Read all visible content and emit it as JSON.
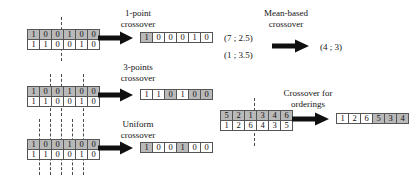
{
  "figure": {
    "title_hidden": "",
    "bit_shaded_color": "#b9b9b9",
    "bit_plain_color": "#ffffff",
    "border_color": "#555555",
    "arrow_color": "#101010",
    "dash_color": "#4a4a4a"
  },
  "binary_parents": {
    "parent1": [
      "1",
      "0",
      "0",
      "1",
      "0",
      "0"
    ],
    "parent2": [
      "1",
      "1",
      "0",
      "0",
      "1",
      "0"
    ]
  },
  "one_point": {
    "label_line1": "1-point",
    "label_line2": "crossover",
    "cut_positions": [
      3
    ],
    "result": {
      "values": [
        "1",
        "0",
        "0",
        "0",
        "1",
        "0"
      ],
      "shading": [
        "shade",
        "plain",
        "plain",
        "plain",
        "plain",
        "plain"
      ]
    }
  },
  "three_points": {
    "label_line1": "3-points",
    "label_line2": "crossover",
    "cut_positions": [
      2,
      3,
      5
    ],
    "result": {
      "values": [
        "1",
        "1",
        "0",
        "1",
        "0",
        "0"
      ],
      "shading": [
        "plain",
        "plain",
        "shade",
        "plain",
        "shade",
        "shade"
      ]
    }
  },
  "uniform": {
    "label_line1": "Uniform",
    "label_line2": "crossover",
    "cut_positions": [
      1,
      2,
      3,
      4,
      5
    ],
    "result": {
      "values": [
        "1",
        "0",
        "0",
        "1",
        "0",
        "0"
      ],
      "shading": [
        "shade",
        "plain",
        "plain",
        "shade",
        "plain",
        "plain"
      ]
    }
  },
  "mean_based": {
    "label_line1": "Mean-based",
    "label_line2": "crossover",
    "parent1": "(7 ; 2.5)",
    "parent2": "(1 ; 3.5)",
    "result": "(4 ; 3)"
  },
  "orderings": {
    "label_line1": "Crossover for",
    "label_line2": "orderings",
    "cut_positions": [
      3
    ],
    "parent1": {
      "values": [
        "5",
        "2",
        "1",
        "3",
        "4",
        "6"
      ],
      "shading": [
        "shade",
        "shade",
        "shade",
        "shade",
        "shade",
        "shade"
      ]
    },
    "parent2": {
      "values": [
        "1",
        "2",
        "6",
        "4",
        "3",
        "5"
      ],
      "shading": [
        "plain",
        "plain",
        "plain",
        "plain",
        "plain",
        "plain"
      ]
    },
    "result": {
      "values": [
        "1",
        "2",
        "6",
        "5",
        "3",
        "4"
      ],
      "shading": [
        "plain",
        "plain",
        "plain",
        "shade",
        "shade",
        "shade"
      ]
    }
  },
  "icons": {
    "arrow": "right-arrow-icon",
    "dash": "dashed-cut-line-icon"
  }
}
